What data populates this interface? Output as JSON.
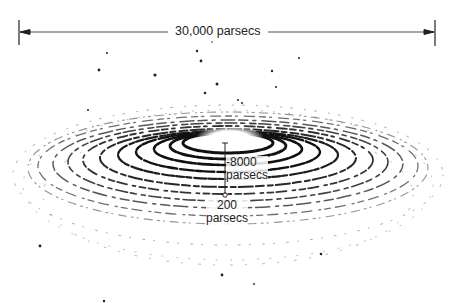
{
  "diagram": {
    "scale_bar": {
      "label": "30,000 parsecs"
    },
    "center_thickness": {
      "value": "8000",
      "unit": "parsecs"
    },
    "disk_thickness": {
      "value": "200",
      "unit": "parsecs"
    },
    "colors": {
      "ink": "#1a1a1a",
      "background": "#ffffff"
    }
  }
}
